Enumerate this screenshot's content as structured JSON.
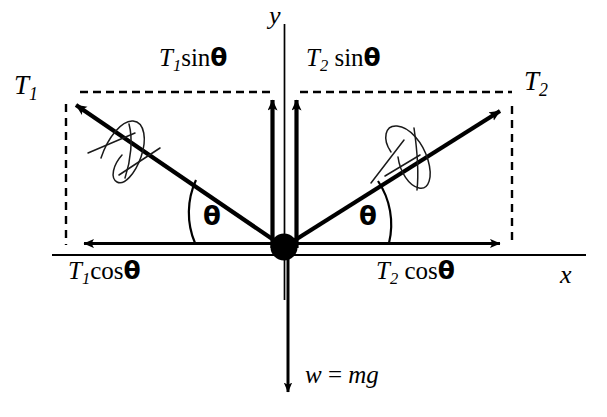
{
  "diagram": {
    "type": "physics-force-diagram",
    "background_color": "#ffffff",
    "stroke_color": "#000000",
    "width": 607,
    "height": 417
  },
  "axes": {
    "y_label": "y",
    "x_label": "x",
    "origin": {
      "x": 284,
      "y": 247
    }
  },
  "node": {
    "name": "point-mass",
    "shape": "filled-circle",
    "radius": 13,
    "color": "#000000"
  },
  "vectors": [
    {
      "id": "T1",
      "label": "T",
      "subscript": "1",
      "direction": "up-left",
      "from": {
        "x": 284,
        "y": 247
      },
      "to": {
        "x": 68,
        "y": 100
      }
    },
    {
      "id": "T2",
      "label": "T",
      "subscript": "2",
      "direction": "up-right",
      "from": {
        "x": 284,
        "y": 247
      },
      "to": {
        "x": 508,
        "y": 105
      }
    },
    {
      "id": "T1sin",
      "label": "T",
      "subscript": "1",
      "trig": "sin",
      "angle_symbol": "θ",
      "direction": "up",
      "from": {
        "x": 273,
        "y": 247
      },
      "to": {
        "x": 273,
        "y": 93
      }
    },
    {
      "id": "T2sin",
      "label": "T",
      "subscript": "2",
      "trig": "sin",
      "angle_symbol": "θ",
      "direction": "up",
      "from": {
        "x": 296,
        "y": 247
      },
      "to": {
        "x": 296,
        "y": 93
      }
    },
    {
      "id": "T1cos",
      "label": "T",
      "subscript": "1",
      "trig": "cos",
      "angle_symbol": "θ",
      "direction": "left",
      "from": {
        "x": 284,
        "y": 243
      },
      "to": {
        "x": 76,
        "y": 243
      }
    },
    {
      "id": "T2cos",
      "label": "T",
      "subscript": "2",
      "trig": "cos",
      "angle_symbol": "θ",
      "direction": "right",
      "from": {
        "x": 284,
        "y": 243
      },
      "to": {
        "x": 508,
        "y": 243
      }
    },
    {
      "id": "weight",
      "label": "w = mg",
      "direction": "down",
      "from": {
        "x": 288,
        "y": 252
      },
      "to": {
        "x": 288,
        "y": 400
      }
    }
  ],
  "labels": {
    "T1": {
      "base": "T",
      "sub": "1"
    },
    "T2": {
      "base": "T",
      "sub": "2"
    },
    "T1_sin_theta": {
      "base": "T",
      "sub": "1",
      "trig": "sin",
      "theta": "θ"
    },
    "T2_sin_theta": {
      "base": "T",
      "sub": "2",
      "trig": "sin",
      "theta": "θ"
    },
    "T1_cos_theta": {
      "base": "T",
      "sub": "1",
      "trig": "cos",
      "theta": "θ"
    },
    "T2_cos_theta": {
      "base": "T",
      "sub": "2",
      "trig": "cos",
      "theta": "θ"
    },
    "theta_left": "θ",
    "theta_right": "θ",
    "weight_equation": {
      "w": "w",
      "equals": "=",
      "mg": "mg"
    },
    "y_axis": "y",
    "x_axis": "x"
  },
  "guides": {
    "dashed_horizontal_left": {
      "x1": 80,
      "x2": 270,
      "y": 92
    },
    "dashed_horizontal_right": {
      "x1": 300,
      "x2": 512,
      "y": 92
    },
    "dashed_vertical_left": {
      "x": 66,
      "y1": 104,
      "y2": 245
    },
    "dashed_vertical_right": {
      "x": 512,
      "y1": 106,
      "y2": 245
    }
  },
  "annotations": {
    "handwritten_marks": [
      {
        "on": "T1",
        "description": "hand-drawn loop and slash crossing the T1 vector"
      },
      {
        "on": "T2",
        "description": "hand-drawn loop and slash crossing the T2 vector"
      }
    ],
    "angle_arcs": [
      {
        "id": "theta-left-arc",
        "at": "between T1 vector and negative x-axis"
      },
      {
        "id": "theta-right-arc",
        "at": "between T2 vector and positive x-axis"
      }
    ]
  }
}
